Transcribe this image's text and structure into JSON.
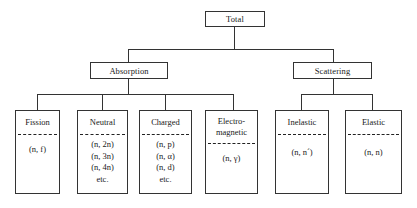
{
  "diagram": {
    "root": {
      "label": "Total"
    },
    "branches": [
      {
        "label": "Absorption"
      },
      {
        "label": "Scattering"
      }
    ],
    "leaves": [
      {
        "name": "fission",
        "head": "Fission",
        "items": [
          "(n, f)"
        ]
      },
      {
        "name": "neutral",
        "head": "Neutral",
        "items": [
          "(n, 2n)",
          "(n, 3n)",
          "(n, 4n)",
          "etc."
        ]
      },
      {
        "name": "charged",
        "head": "Charged",
        "items": [
          "(n, p)",
          "(n, α)",
          "(n, d)",
          "etc."
        ]
      },
      {
        "name": "electromagnetic",
        "head": "Electro-\nmagnetic",
        "items": [
          "(n, γ)"
        ]
      },
      {
        "name": "inelastic",
        "head": "Inelastic",
        "items": [
          "(n, n´)"
        ]
      },
      {
        "name": "elastic",
        "head": "Elastic",
        "items": [
          "(n, n)"
        ]
      }
    ],
    "colors": {
      "line": "#333333",
      "divider": "#222222",
      "text": "#1a1a1a",
      "background": "#ffffff"
    }
  }
}
